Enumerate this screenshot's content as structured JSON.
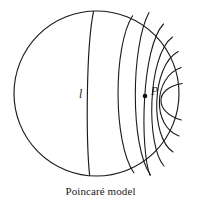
{
  "figure": {
    "name": "poincare-disk-model",
    "caption": "Poincaré model",
    "background_color": "#ffffff",
    "stroke_color": "#1a1a1a",
    "labels": {
      "line_label": "l",
      "point_label": "P"
    },
    "boundary_circle": {
      "center_x": 96.5,
      "center_y": 93.5,
      "radius": 82.5,
      "stroke_width": 1.1
    },
    "point_P": {
      "x": 145,
      "y": 96,
      "marker_radius": 2.2
    },
    "line_l": {
      "label": "l",
      "start": {
        "x": 93.5,
        "y": 11.5
      },
      "end": {
        "x": 89.5,
        "y": 175.5
      },
      "bulge_x": 87.5
    },
    "geodesics_through_P": [
      {
        "id": "g1",
        "start_x": 133,
        "start_y": 16,
        "end_x": 134,
        "end_y": 173,
        "bow": "left"
      },
      {
        "id": "g2",
        "start_x": 150,
        "start_y": 14,
        "end_x": 151,
        "end_y": 175,
        "bow": "slight-left"
      },
      {
        "id": "g3",
        "start_x": 163,
        "start_y": 25,
        "end_x": 150,
        "end_y": 175,
        "bow": "right"
      },
      {
        "id": "g4",
        "start_x": 172,
        "start_y": 37,
        "end_x": 164,
        "end_y": 166,
        "bow": "right"
      },
      {
        "id": "g5",
        "start_x": 178,
        "start_y": 52,
        "end_x": 173,
        "end_y": 152,
        "bow": "right"
      },
      {
        "id": "g6",
        "start_x": 181,
        "start_y": 68,
        "end_x": 179,
        "end_y": 136,
        "bow": "right"
      },
      {
        "id": "g7",
        "start_x": 182,
        "start_y": 84,
        "end_x": 181,
        "end_y": 120,
        "bow": "right"
      }
    ],
    "geodesic_count": 7,
    "description_semantics": {
      "element_names": [
        "boundary-circle",
        "geodesic-line-l",
        "geodesic-fan-through-P",
        "point-P-marker",
        "figure-caption"
      ]
    }
  }
}
